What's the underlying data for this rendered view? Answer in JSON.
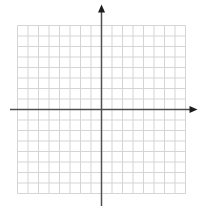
{
  "figure": {
    "title": "",
    "xlabel": "",
    "ylabel": ""
  },
  "chart_data": {
    "type": "scatter",
    "series": [],
    "title": "",
    "xlabel": "",
    "ylabel": "",
    "xlim": [
      -8,
      8
    ],
    "ylim": [
      -8,
      8
    ],
    "tick_step": 1,
    "grid": true,
    "tick_labels_shown": false,
    "axis_labels_shown": false,
    "axis_arrows": {
      "x_axis": "right",
      "y_axis": "up"
    },
    "quadrants": 4
  },
  "colors": {
    "background": "#ffffff",
    "grid_line": "#d5d5d5",
    "axis_line": "#4f4f4f",
    "arrowhead": "#1d1d1d"
  }
}
